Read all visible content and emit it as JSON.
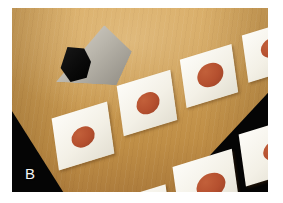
{
  "figure": {
    "panel_label": "B",
    "width": 283,
    "height": 203,
    "margin_color": "#ffffff"
  },
  "scene": {
    "background_color": "#050505",
    "table_color": "#c89a52",
    "card_color": "#f6f3ea",
    "dot_color": "#b5502f",
    "description": "Wooden tabletop viewed at an oblique angle against a black background, with white cards arranged in two rows.",
    "objects": [
      {
        "name": "upright-gray-panel",
        "color": "#bab6ac"
      },
      {
        "name": "black-block",
        "color": "#0d0d0d"
      }
    ]
  },
  "cards": {
    "count": 10,
    "blank_count": 1,
    "dot_count": 9,
    "rows": [
      {
        "name": "back-row",
        "items": [
          {
            "id": "card-1",
            "dot": true,
            "dot_size": "medium",
            "order": 1
          },
          {
            "id": "card-2",
            "dot": true,
            "dot_size": "medium",
            "order": 2
          },
          {
            "id": "card-3",
            "dot": true,
            "dot_size": "medium-large",
            "order": 3
          },
          {
            "id": "card-4",
            "dot": true,
            "dot_size": "medium",
            "order": 4
          },
          {
            "id": "card-5",
            "dot": false,
            "dot_size": "none",
            "order": 5
          }
        ]
      },
      {
        "name": "front-row",
        "items": [
          {
            "id": "card-6",
            "dot": true,
            "dot_size": "large",
            "order": 1
          },
          {
            "id": "card-7",
            "dot": true,
            "dot_size": "large",
            "order": 2
          },
          {
            "id": "card-8",
            "dot": true,
            "dot_size": "medium",
            "order": 3
          },
          {
            "id": "card-9",
            "dot": true,
            "dot_size": "small",
            "order": 4
          },
          {
            "id": "card-10",
            "dot": true,
            "dot_size": "small",
            "order": 5
          }
        ]
      }
    ]
  }
}
